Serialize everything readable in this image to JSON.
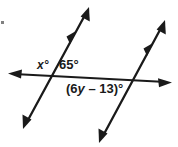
{
  "figure": {
    "kind": "geometry-diagram",
    "background_color": "#ffffff",
    "stroke_color": "#1a1a1a",
    "labels": {
      "angle_x": "x°",
      "angle_65": "65°",
      "angle_6y_prefix": "(6",
      "angle_6y_var": "y",
      "angle_6y_suffix": " – 13)°",
      "angle_6y_full": "(6y – 13)°"
    },
    "lines": [
      {
        "name": "parallel-line-left",
        "role": "parallel",
        "tick_marks": 1,
        "arrow_start": "down-left",
        "arrow_end": "up-right"
      },
      {
        "name": "parallel-line-right",
        "role": "parallel",
        "tick_marks": 1,
        "arrow_start": "down-left",
        "arrow_end": "up-right"
      },
      {
        "name": "transversal-line",
        "role": "transversal",
        "tick_marks": 0,
        "arrow_start": "left",
        "arrow_end": "right"
      }
    ],
    "intersections": [
      {
        "name": "intersection-left",
        "x": 52,
        "y": 78
      },
      {
        "name": "intersection-right",
        "x": 132,
        "y": 80
      }
    ]
  }
}
